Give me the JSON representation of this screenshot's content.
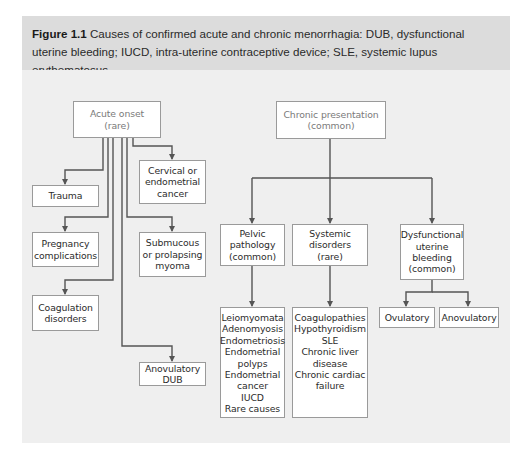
{
  "caption": {
    "label": "Figure 1.1",
    "text": " Causes of confirmed acute and chronic menorrhagia: DUB, dysfunctional uterine bleeding; IUCD, intra-uterine contraceptive device; SLE, systemic lupus erythematosus."
  },
  "acute": {
    "title": "Acute onset\n(rare)",
    "causes": [
      "Trauma",
      "Pregnancy\ncomplications",
      "Coagulation\ndisorders",
      "Cervical or\nendometrial\ncancer",
      "Submucous\nor prolapsing\nmyoma",
      "Anovulatory\nDUB"
    ]
  },
  "chronic": {
    "title": "Chronic presentation\n(common)",
    "pelvic": {
      "title": "Pelvic\npathology\n(common)",
      "items": "Leiomyomata\nAdenomyosis\nEndometriosis\nEndometrial\npolyps\nEndometrial\ncancer\nIUCD\nRare causes"
    },
    "systemic": {
      "title": "Systemic\ndisorders\n(rare)",
      "items": "Coagulopathies\nHypothyroidism\nSLE\nChronic liver\ndisease\nChronic cardiac\nfailure"
    },
    "dub": {
      "title": "Dysfunctional\nuterine\nbleeding\n(common)",
      "subtypes": [
        "Ovulatory",
        "Anovulatory"
      ]
    }
  },
  "colors": {
    "caption_bg": "#dcdcdc",
    "panel_bg": "#efefef",
    "line": "#555555",
    "box_border": "#9a9a9a"
  }
}
